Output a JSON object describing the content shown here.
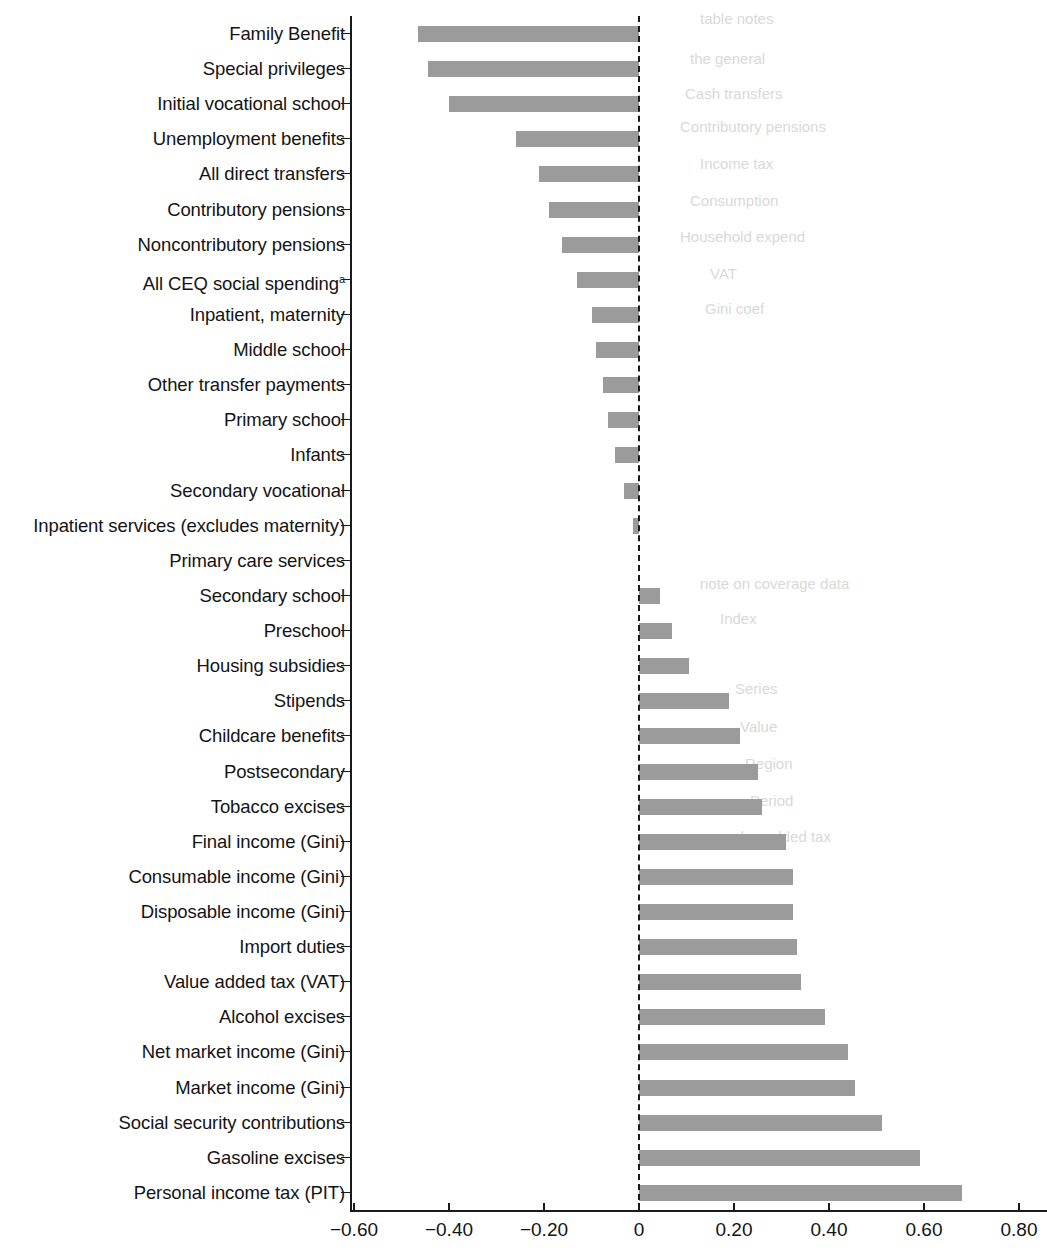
{
  "chart_data": {
    "type": "bar",
    "orientation": "horizontal",
    "title": "",
    "subtitle": "",
    "xlabel": "",
    "ylabel": "",
    "xlim": [
      -0.6,
      0.8
    ],
    "xticks": [
      -0.6,
      -0.4,
      -0.2,
      0,
      0.2,
      0.4,
      0.6,
      0.8
    ],
    "xtick_labels": [
      "−0.60",
      "−0.40",
      "−0.20",
      "0",
      "0.20",
      "0.40",
      "0.60",
      "0.80"
    ],
    "grid": false,
    "legend": null,
    "zero_reference_line": true,
    "bar_color": "#9b9b9b",
    "axis_color": "#1a1a1a",
    "categories": [
      "Family Benefit",
      "Special privileges",
      "Initial vocational school",
      "Unemployment benefits",
      "All direct transfers",
      "Contributory pensions",
      "Noncontributory pensions",
      "All CEQ social spending",
      "Inpatient, maternity",
      "Middle school",
      "Other transfer payments",
      "Primary school",
      "Infants",
      "Secondary vocational",
      "Inpatient services (excludes maternity)",
      "Primary care services",
      "Secondary school",
      "Preschool",
      "Housing subsidies",
      "Stipends",
      "Childcare benefits",
      "Postsecondary",
      "Tobacco excises",
      "Final income (Gini)",
      "Consumable income (Gini)",
      "Disposable income (Gini)",
      "Import duties",
      "Value added tax (VAT)",
      "Alcohol excises",
      "Net market income (Gini)",
      "Market income (Gini)",
      "Social security contributions",
      "Gasoline excises",
      "Personal income tax (PIT)"
    ],
    "values": [
      -0.465,
      -0.445,
      -0.4,
      -0.26,
      -0.21,
      -0.19,
      -0.163,
      -0.13,
      -0.1,
      -0.09,
      -0.075,
      -0.065,
      -0.05,
      -0.032,
      -0.012,
      0.0,
      0.045,
      0.07,
      0.105,
      0.19,
      0.212,
      0.25,
      0.258,
      0.31,
      0.325,
      0.325,
      0.332,
      0.342,
      0.392,
      0.44,
      0.455,
      0.512,
      0.592,
      0.68
    ],
    "footnote_markers": {
      "All CEQ social spending": "a"
    }
  },
  "ghost_text": [
    "table notes",
    "the general",
    "Cash transfers",
    "Contributory pensions",
    "Income tax",
    "Consumption",
    "Household expend",
    "VAT",
    "Gini coef",
    "note on coverage data",
    "Index",
    "Series",
    "Value",
    "Region",
    "Period",
    "value added tax"
  ]
}
